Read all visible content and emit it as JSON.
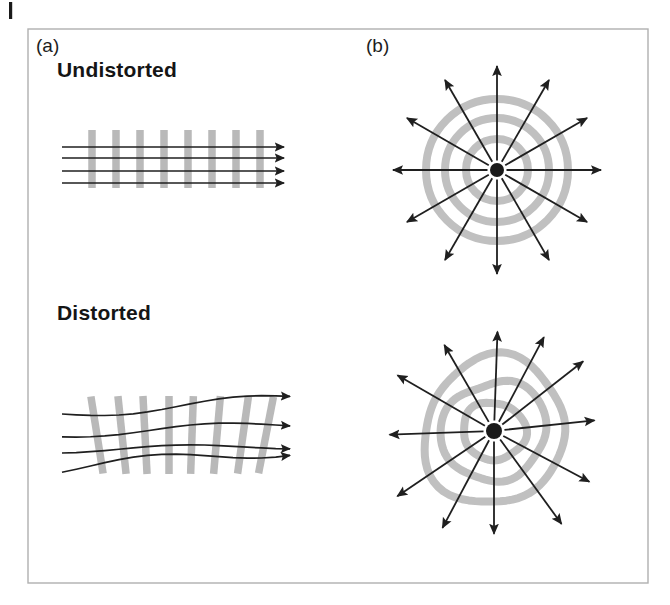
{
  "figure": {
    "background_color": "#ffffff",
    "frame": {
      "x": 28,
      "y": 29,
      "width": 620,
      "height": 554,
      "stroke": "#b0b0b0",
      "stroke_width": 1.4,
      "name": "figure-border"
    },
    "corner_tick": {
      "x": 9,
      "y": 2,
      "width": 3.2,
      "height": 17,
      "color": "#1a1a1a"
    },
    "colors": {
      "grating_gray": "#b9b9b9",
      "ring_gray": "#c0c0c0",
      "line_dark": "#1f1f1f",
      "text_dark": "#151515",
      "frame_gray": "#b0b0b0",
      "center_dot": "#1a1a1a"
    },
    "panels": [
      {
        "id": "a",
        "label": "(a)",
        "x": 36,
        "y": 52
      },
      {
        "id": "b",
        "label": "(b)",
        "x": 366,
        "y": 52
      }
    ],
    "conditions": [
      {
        "id": "undistorted",
        "label": "Undistorted",
        "x": 57,
        "y": 77
      },
      {
        "id": "distorted",
        "label": "Distorted",
        "x": 57,
        "y": 320
      }
    ]
  },
  "chart_data": {
    "type": "diagram",
    "panels": [
      {
        "id": "a",
        "label": "(a)",
        "stimulus": "linear-grating",
        "rows": [
          {
            "condition": "Undistorted",
            "bars": {
              "count": 8,
              "x_positions": [
                92,
                116,
                140,
                164,
                188,
                212,
                236,
                260
              ],
              "width": 7.5,
              "top": 130,
              "bottom": 188,
              "tilt_deg": [
                0,
                0,
                0,
                0,
                0,
                0,
                0,
                0
              ],
              "color": "#b9b9b9"
            },
            "rays": {
              "count": 4,
              "x_start": 62,
              "x_end": 284,
              "y_values": [
                147,
                158,
                171,
                183
              ],
              "wavy": false,
              "color": "#1f1f1f",
              "stroke_width": 1.7,
              "arrowhead": true
            }
          },
          {
            "condition": "Distorted",
            "bars": {
              "count": 8,
              "x_positions": [
                97,
                122,
                145,
                169,
                192,
                217,
                243,
                266
              ],
              "width": 7.5,
              "top": 396,
              "bottom": 474,
              "tilt_deg": [
                -9,
                -6,
                -3,
                0,
                2,
                5,
                8,
                11
              ],
              "color": "#b9b9b9"
            },
            "rays": {
              "count": 4,
              "x_start": 62,
              "x_end": 290,
              "y_values": [
                414,
                434,
                450,
                468
              ],
              "wavy": true,
              "color": "#1f1f1f",
              "stroke_width": 1.7,
              "arrowhead": true
            }
          }
        ]
      },
      {
        "id": "b",
        "label": "(b)",
        "stimulus": "radial-rings",
        "rows": [
          {
            "condition": "Undistorted",
            "center": {
              "x": 497,
              "y": 170
            },
            "center_dot_radius": 7,
            "rings": {
              "count": 3,
              "radii": [
                31,
                52,
                71
              ],
              "stroke_width": 8,
              "color": "#c0c0c0",
              "regular": true
            },
            "rays": {
              "count": 12,
              "angles_deg": [
                0,
                30,
                60,
                90,
                120,
                150,
                180,
                210,
                240,
                270,
                300,
                330
              ],
              "length": 104,
              "color": "#1f1f1f",
              "stroke_width": 1.8,
              "arrowhead": true
            }
          },
          {
            "condition": "Distorted",
            "center": {
              "x": 494,
              "y": 431
            },
            "center_dot_radius": 8,
            "rings": {
              "count": 3,
              "radii": [
                30,
                51,
                72
              ],
              "stroke_width": 8,
              "color": "#c0c0c0",
              "regular": false
            },
            "rays": {
              "count": 12,
              "angles_deg": [
                2,
                28,
                52,
                84,
                118,
                144,
                180,
                208,
                236,
                268,
                300,
                330
              ],
              "length": 108,
              "color": "#1f1f1f",
              "stroke_width": 1.8,
              "arrowhead": true
            }
          }
        ]
      }
    ]
  }
}
